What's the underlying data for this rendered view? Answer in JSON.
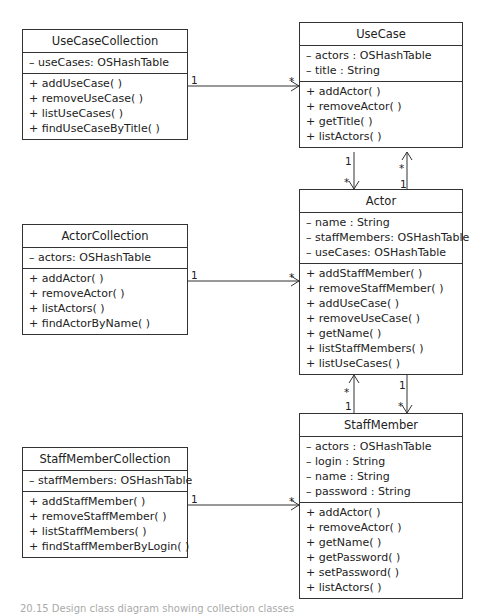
{
  "diagram": {
    "type": "UML class diagram",
    "classes": [
      {
        "id": "usecasecollection",
        "name": "UseCaseCollection",
        "attributes": [
          "– useCases: OSHashTable"
        ],
        "operations": [
          "+ addUseCase( )",
          "+ removeUseCase( )",
          "+ listUseCases( )",
          "+ findUseCaseByTitle( )"
        ]
      },
      {
        "id": "usecase",
        "name": "UseCase",
        "attributes": [
          "– actors : OSHashTable",
          "– title : String"
        ],
        "operations": [
          "+ addActor( )",
          "+ removeActor( )",
          "+ getTitle( )",
          "+ listActors( )"
        ]
      },
      {
        "id": "actorcollection",
        "name": "ActorCollection",
        "attributes": [
          "– actors: OSHashTable"
        ],
        "operations": [
          "+ addActor( )",
          "+ removeActor( )",
          "+ listActors( )",
          "+ findActorByName( )"
        ]
      },
      {
        "id": "actor",
        "name": "Actor",
        "attributes": [
          "– name : String",
          "– staffMembers: OSHashTable",
          "– useCases: OSHashTable"
        ],
        "operations": [
          "+ addStaffMember( )",
          "+ removeStaffMember( )",
          "+ addUseCase( )",
          "+ removeUseCase( )",
          "+ getName( )",
          "+ listStaffMembers( )",
          "+ listUseCases( )"
        ]
      },
      {
        "id": "staffmembercollection",
        "name": "StaffMemberCollection",
        "attributes": [
          "– staffMembers: OSHashTable"
        ],
        "operations": [
          "+ addStaffMember( )",
          "+ removeStaffMember( )",
          "+ listStaffMembers( )",
          "+ findStaffMemberByLogin( )"
        ]
      },
      {
        "id": "staffmember",
        "name": "StaffMember",
        "attributes": [
          "– actors : OSHashTable",
          "– login : String",
          "– name : String",
          "– password : String"
        ],
        "operations": [
          "+ addActor( )",
          "+ removeActor( )",
          "+ getName( )",
          "+ getPassword( )",
          "+ setPassword( )",
          "+ listActors( )"
        ]
      }
    ],
    "associations": [
      {
        "from": "UseCaseCollection",
        "to": "UseCase",
        "from_mult": "1",
        "to_mult": "*"
      },
      {
        "from": "ActorCollection",
        "to": "Actor",
        "from_mult": "1",
        "to_mult": "*"
      },
      {
        "from": "StaffMemberCollection",
        "to": "StaffMember",
        "from_mult": "1",
        "to_mult": "*"
      },
      {
        "from": "UseCase",
        "to": "Actor",
        "from_mult": "1",
        "to_mult": "*"
      },
      {
        "from": "Actor",
        "to": "UseCase",
        "from_mult": "1",
        "to_mult": "*"
      },
      {
        "from": "Actor",
        "to": "StaffMember",
        "from_mult": "1",
        "to_mult": "*"
      },
      {
        "from": "StaffMember",
        "to": "Actor",
        "from_mult": "1",
        "to_mult": "*"
      }
    ],
    "multiplicity_labels": {
      "one": "1",
      "many": "*"
    }
  },
  "caption": {
    "partial_text": "20.15 Design class diagram showing collection classes"
  }
}
